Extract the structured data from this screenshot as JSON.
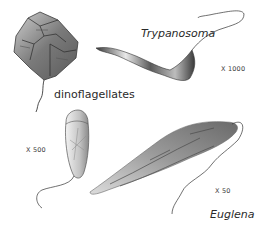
{
  "organisms": [
    {
      "id": "dinoflagellate",
      "label": "dinoflagellates",
      "italic": false
    },
    {
      "id": "trypanosoma",
      "label": "Trypanosoma",
      "italic": true,
      "magnification": "X 1000"
    },
    {
      "id": "small-flagellate",
      "label": "",
      "magnification": "X 500"
    },
    {
      "id": "euglena",
      "label": "Euglena",
      "italic": true,
      "magnification": "X 50"
    }
  ],
  "colors": {
    "background": "#ffffff",
    "ink": "#2a2a2a",
    "shade_dark": "#4a4a4a",
    "shade_mid": "#8a8a8a",
    "shade_light": "#d4d4d4"
  }
}
